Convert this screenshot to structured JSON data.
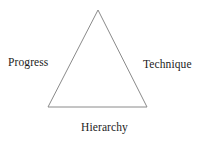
{
  "diagram": {
    "type": "triangle-diagram",
    "shape_name": "triangle",
    "background_color": "#ffffff",
    "stroke_color": "#8a8a8a",
    "stroke_width": 1,
    "text_color": "#1c1c1c",
    "vertices": {
      "apex": {
        "x": 98,
        "y": 10
      },
      "bottom_left": {
        "x": 48,
        "y": 107
      },
      "bottom_right": {
        "x": 147,
        "y": 107
      }
    },
    "labels": {
      "left": "Progress",
      "right": "Technique",
      "bottom": "Hierarchy"
    }
  }
}
